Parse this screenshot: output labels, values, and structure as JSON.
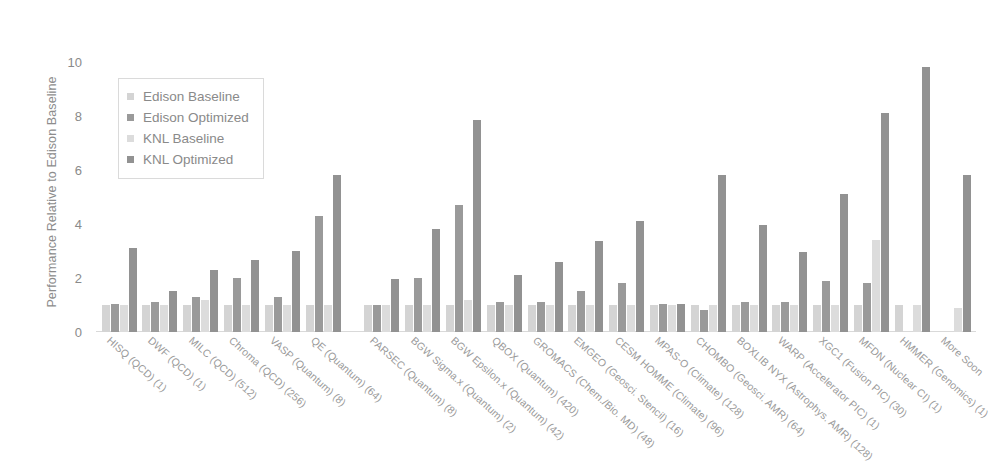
{
  "chart_data": {
    "type": "bar",
    "title": "",
    "subtitle": "",
    "xlabel": "",
    "ylabel": "Performance Relative to Edison Baseline",
    "ylim": [
      0,
      10.8
    ],
    "yticks": [
      0,
      2,
      4,
      6,
      8,
      10
    ],
    "ytick_labels": [
      "0",
      "2",
      "4",
      "6",
      "8",
      "10"
    ],
    "grid": false,
    "legend_position": "upper-left-inside",
    "orientation": "vertical",
    "grouping": "grouped",
    "categories": [
      "HISQ (QCD) (1)",
      "DWF (QCD) (1)",
      "MILC (QCD) (512)",
      "Chroma (QCD) (256)",
      "VASP (Quantum) (8)",
      "QE (Quantum) (64)",
      "PARSEC (Quantum) (8)",
      "BGW Sigma.x (Quantum) (2)",
      "BGW Epsilon.x (Quantum) (42)",
      "QBOX (Quantum) (420)",
      "GROMACS (Chem./Bio. MD) (48)",
      "EMGEO (Geosci. Stencil) (16)",
      "CESM HOMME (Climate) (96)",
      "MPAS-O (Climate) (128)",
      "CHOMBO (Geosci. AMR) (64)",
      "BOXLIB NYX (Astrophys. AMR) (128)",
      "WARP (Accelerator PIC) (1)",
      "XGC1 (Fusion PIC) (30)",
      "MFDN (Nuclear CI) (1)",
      "HMMER (Genomics) (1)",
      "More Soon"
    ],
    "series": [
      {
        "name": "Edison Baseline",
        "color": "#d4d4d4",
        "values": [
          1.0,
          1.0,
          1.0,
          1.0,
          1.0,
          1.0,
          1.0,
          1.0,
          1.0,
          1.0,
          1.0,
          1.0,
          1.0,
          1.0,
          1.0,
          1.0,
          1.0,
          1.0,
          1.0,
          1.0,
          0.0
        ]
      },
      {
        "name": "Edison Optimized",
        "color": "#9a9a9a",
        "values": [
          1.05,
          1.1,
          1.3,
          2.0,
          1.3,
          4.3,
          1.0,
          2.0,
          4.7,
          1.1,
          1.1,
          1.5,
          1.8,
          1.05,
          0.8,
          1.1,
          1.1,
          1.9,
          1.8,
          0.0,
          0.0
        ]
      },
      {
        "name": "KNL Baseline",
        "color": "#dcdcdc",
        "values": [
          1.0,
          1.0,
          1.2,
          1.0,
          1.0,
          1.0,
          1.0,
          1.0,
          1.2,
          1.0,
          1.0,
          1.0,
          1.0,
          1.0,
          1.0,
          1.0,
          1.0,
          1.0,
          3.4,
          1.0,
          0.9
        ]
      },
      {
        "name": "KNL Optimized",
        "color": "#929292",
        "values": [
          3.1,
          1.5,
          2.3,
          2.65,
          3.0,
          5.8,
          1.95,
          3.8,
          7.85,
          2.1,
          2.6,
          3.35,
          4.1,
          1.05,
          5.8,
          3.95,
          2.95,
          5.1,
          8.1,
          9.8,
          5.8
        ]
      }
    ],
    "bar_rows": [
      {
        "label": "HISQ (QCD) (1)",
        "values": [
          1.0,
          1.05,
          1.0,
          3.1
        ]
      },
      {
        "label": "DWF (QCD) (1)",
        "values": [
          1.0,
          1.1,
          1.0,
          1.5
        ]
      },
      {
        "label": "MILC (QCD) (512)",
        "values": [
          1.0,
          1.3,
          1.2,
          2.3
        ]
      },
      {
        "label": "Chroma (QCD) (256)",
        "values": [
          1.0,
          2.0,
          1.0,
          2.65
        ]
      },
      {
        "label": "VASP (Quantum) (8)",
        "values": [
          1.0,
          1.3,
          1.0,
          3.0
        ]
      },
      {
        "label": "QE (Quantum) (64)",
        "values": [
          1.0,
          4.3,
          1.0,
          5.8
        ]
      },
      {
        "label": "PARSEC (Quantum) (8)",
        "values": [
          1.0,
          1.0,
          1.0,
          1.95
        ]
      },
      {
        "label": "BGW Sigma.x (Quantum) (2)",
        "values": [
          1.0,
          2.0,
          1.0,
          3.8
        ]
      },
      {
        "label": "BGW Epsilon.x (Quantum) (42)",
        "values": [
          1.0,
          4.7,
          1.2,
          7.85
        ]
      },
      {
        "label": "QBOX (Quantum) (420)",
        "values": [
          1.0,
          1.1,
          1.0,
          2.1
        ]
      },
      {
        "label": "GROMACS (Chem./Bio. MD) (48)",
        "values": [
          1.0,
          1.1,
          1.0,
          2.6
        ]
      },
      {
        "label": "EMGEO (Geosci. Stencil) (16)",
        "values": [
          1.0,
          1.5,
          1.0,
          3.35
        ]
      },
      {
        "label": "CESM HOMME (Climate) (96)",
        "values": [
          1.0,
          1.8,
          1.0,
          4.1
        ]
      },
      {
        "label": "MPAS-O (Climate) (128)",
        "values": [
          1.0,
          1.05,
          1.0,
          1.05
        ]
      },
      {
        "label": "CHOMBO (Geosci. AMR) (64)",
        "values": [
          1.0,
          0.8,
          1.0,
          5.8
        ]
      },
      {
        "label": "BOXLIB NYX (Astrophys. AMR) (128)",
        "values": [
          1.0,
          1.1,
          1.0,
          3.95
        ]
      },
      {
        "label": "WARP (Accelerator PIC) (1)",
        "values": [
          1.0,
          1.1,
          1.0,
          2.95
        ]
      },
      {
        "label": "XGC1 (Fusion PIC) (30)",
        "values": [
          1.0,
          1.9,
          1.0,
          5.1
        ]
      },
      {
        "label": "MFDN (Nuclear CI) (1)",
        "values": [
          1.0,
          1.8,
          3.4,
          8.1
        ]
      },
      {
        "label": "HMMER (Genomics) (1)",
        "values": [
          1.0,
          0.0,
          1.0,
          9.8
        ]
      },
      {
        "label": "More Soon",
        "values": [
          0.0,
          0.0,
          0.9,
          5.8
        ]
      }
    ]
  },
  "legend": {
    "items": [
      {
        "label": "Edison Baseline",
        "color": "#d4d4d4",
        "swatch": "square-marker"
      },
      {
        "label": "Edison Optimized",
        "color": "#9a9a9a",
        "swatch": "square-marker"
      },
      {
        "label": "KNL Baseline",
        "color": "#dcdcdc",
        "swatch": "square-marker"
      },
      {
        "label": "KNL Optimized",
        "color": "#929292",
        "swatch": "square-marker"
      }
    ]
  },
  "axes": {
    "y_title": "Performance Relative to Edison Baseline",
    "y_tick_labels": [
      "10",
      "8",
      "6",
      "4",
      "2",
      "0"
    ]
  }
}
